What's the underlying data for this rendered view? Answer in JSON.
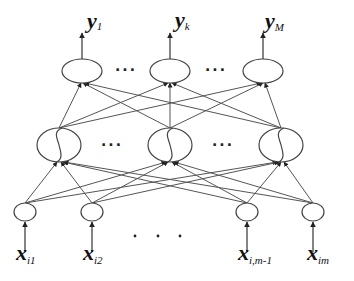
{
  "diagram": {
    "type": "feedforward-neural-network",
    "layers": {
      "output": {
        "nodes": [
          {
            "cx": 82,
            "cy": 71,
            "label_var": "y",
            "label_sub": "1"
          },
          {
            "cx": 170,
            "cy": 71,
            "label_var": "y",
            "label_sub": "k"
          },
          {
            "cx": 263,
            "cy": 71,
            "label_var": "y",
            "label_sub": "M"
          }
        ],
        "rx": 20,
        "ry": 12,
        "ellipsis": [
          "···",
          "···"
        ]
      },
      "hidden": {
        "nodes": [
          {
            "cx": 59,
            "cy": 145
          },
          {
            "cx": 170,
            "cy": 145
          },
          {
            "cx": 281,
            "cy": 145
          }
        ],
        "rx": 22,
        "ry": 17,
        "activation": "sigmoid",
        "ellipsis": [
          "···",
          "···"
        ]
      },
      "input": {
        "nodes": [
          {
            "cx": 25,
            "cy": 212,
            "label_var": "x",
            "label_sub": "i1"
          },
          {
            "cx": 92,
            "cy": 212,
            "label_var": "x",
            "label_sub": "i2"
          },
          {
            "cx": 247,
            "cy": 212,
            "label_var": "x",
            "label_sub": "i,m-1"
          },
          {
            "cx": 313,
            "cy": 212,
            "label_var": "x",
            "label_sub": "im"
          }
        ],
        "rx": 11,
        "ry": 9,
        "ellipsis": "· · ·"
      }
    },
    "labels": {
      "y1": {
        "var": "y",
        "sub": "1"
      },
      "yk": {
        "var": "y",
        "sub": "k"
      },
      "yM": {
        "var": "y",
        "sub": "M"
      },
      "xi1": {
        "var": "x",
        "sub": "i1"
      },
      "xi2": {
        "var": "x",
        "sub": "i2"
      },
      "xim1": {
        "var": "x",
        "sub": "i,m-1"
      },
      "xim": {
        "var": "x",
        "sub": "im"
      },
      "dots_output": "···",
      "dots_hidden": "···"
    },
    "colors": {
      "stroke": "#444444",
      "background": "#ffffff"
    }
  }
}
